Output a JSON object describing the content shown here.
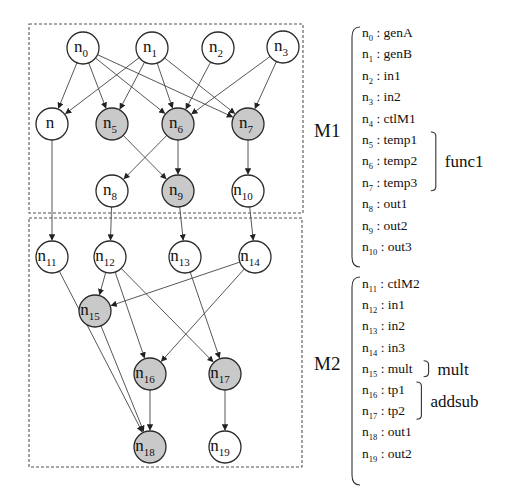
{
  "colors": {
    "highlight_fill": "#c9c9c9",
    "plain_fill": "#ffffff",
    "edge": "#444444"
  },
  "modules": [
    {
      "id": "M1",
      "label": "M1"
    },
    {
      "id": "M2",
      "label": "M2"
    }
  ],
  "nodes": [
    {
      "id": "n0",
      "base": "n",
      "sub": "0",
      "highlight": false,
      "module": "M1"
    },
    {
      "id": "n1",
      "base": "n",
      "sub": "1",
      "highlight": false,
      "module": "M1"
    },
    {
      "id": "n2",
      "base": "n",
      "sub": "2",
      "highlight": false,
      "module": "M1"
    },
    {
      "id": "n3",
      "base": "n",
      "sub": "3",
      "highlight": false,
      "module": "M1"
    },
    {
      "id": "n4",
      "base": "n",
      "sub": "",
      "highlight": false,
      "module": "M1"
    },
    {
      "id": "n5",
      "base": "n",
      "sub": "5",
      "highlight": true,
      "module": "M1"
    },
    {
      "id": "n6",
      "base": "n",
      "sub": "6",
      "highlight": true,
      "module": "M1"
    },
    {
      "id": "n7",
      "base": "n",
      "sub": "7",
      "highlight": true,
      "module": "M1"
    },
    {
      "id": "n8",
      "base": "n",
      "sub": "8",
      "highlight": false,
      "module": "M1"
    },
    {
      "id": "n9",
      "base": "n",
      "sub": "9",
      "highlight": true,
      "module": "M1"
    },
    {
      "id": "n10",
      "base": "n",
      "sub": "10",
      "highlight": false,
      "module": "M1"
    },
    {
      "id": "n11",
      "base": "n",
      "sub": "11",
      "highlight": false,
      "module": "M2"
    },
    {
      "id": "n12",
      "base": "n",
      "sub": "12",
      "highlight": false,
      "module": "M2"
    },
    {
      "id": "n13",
      "base": "n",
      "sub": "13",
      "highlight": false,
      "module": "M2"
    },
    {
      "id": "n14",
      "base": "n",
      "sub": "14",
      "highlight": false,
      "module": "M2"
    },
    {
      "id": "n15",
      "base": "n",
      "sub": "15",
      "highlight": true,
      "module": "M2"
    },
    {
      "id": "n16",
      "base": "n",
      "sub": "16",
      "highlight": true,
      "module": "M2"
    },
    {
      "id": "n17",
      "base": "n",
      "sub": "17",
      "highlight": true,
      "module": "M2"
    },
    {
      "id": "n18",
      "base": "n",
      "sub": "18",
      "highlight": true,
      "module": "M2"
    },
    {
      "id": "n19",
      "base": "n",
      "sub": "19",
      "highlight": false,
      "module": "M2"
    }
  ],
  "edges": [
    [
      "n0",
      "n4"
    ],
    [
      "n0",
      "n5"
    ],
    [
      "n0",
      "n6"
    ],
    [
      "n0",
      "n7"
    ],
    [
      "n1",
      "n4"
    ],
    [
      "n1",
      "n5"
    ],
    [
      "n1",
      "n6"
    ],
    [
      "n1",
      "n7"
    ],
    [
      "n2",
      "n6"
    ],
    [
      "n3",
      "n6"
    ],
    [
      "n3",
      "n7"
    ],
    [
      "n6",
      "n8"
    ],
    [
      "n5",
      "n9"
    ],
    [
      "n6",
      "n9"
    ],
    [
      "n7",
      "n10"
    ],
    [
      "n4",
      "n11"
    ],
    [
      "n8",
      "n12"
    ],
    [
      "n9",
      "n13"
    ],
    [
      "n10",
      "n14"
    ],
    [
      "n12",
      "n15"
    ],
    [
      "n14",
      "n15"
    ],
    [
      "n12",
      "n16"
    ],
    [
      "n14",
      "n16"
    ],
    [
      "n12",
      "n17"
    ],
    [
      "n13",
      "n17"
    ],
    [
      "n11",
      "n18"
    ],
    [
      "n15",
      "n18"
    ],
    [
      "n16",
      "n18"
    ],
    [
      "n17",
      "n19"
    ]
  ],
  "legend": {
    "M1": {
      "entries": [
        {
          "base": "n",
          "sub": "0",
          "name": "genA"
        },
        {
          "base": "n",
          "sub": "1",
          "name": "genB"
        },
        {
          "base": "n",
          "sub": "2",
          "name": "in1"
        },
        {
          "base": "n",
          "sub": "3",
          "name": "in2"
        },
        {
          "base": "n",
          "sub": "4",
          "name": "ctlM1"
        },
        {
          "base": "n",
          "sub": "5",
          "name": "temp1"
        },
        {
          "base": "n",
          "sub": "6",
          "name": "temp2"
        },
        {
          "base": "n",
          "sub": "7",
          "name": "temp3"
        },
        {
          "base": "n",
          "sub": "8",
          "name": "out1"
        },
        {
          "base": "n",
          "sub": "9",
          "name": "out2"
        },
        {
          "base": "n",
          "sub": "10",
          "name": "out3"
        }
      ],
      "groups": [
        {
          "label": "func1",
          "from": 5,
          "to": 7
        }
      ]
    },
    "M2": {
      "entries": [
        {
          "base": "n",
          "sub": "11",
          "name": "ctlM2"
        },
        {
          "base": "n",
          "sub": "12",
          "name": "in1"
        },
        {
          "base": "n",
          "sub": "13",
          "name": "in2"
        },
        {
          "base": "n",
          "sub": "14",
          "name": "in3"
        },
        {
          "base": "n",
          "sub": "15",
          "name": "mult"
        },
        {
          "base": "n",
          "sub": "16",
          "name": "tp1"
        },
        {
          "base": "n",
          "sub": "17",
          "name": "tp2"
        },
        {
          "base": "n",
          "sub": "18",
          "name": "out1"
        },
        {
          "base": "n",
          "sub": "19",
          "name": "out2"
        }
      ],
      "groups": [
        {
          "label": "mult",
          "from": 4,
          "to": 4
        },
        {
          "label": "addsub",
          "from": 5,
          "to": 6
        }
      ]
    },
    "separator": ":"
  }
}
